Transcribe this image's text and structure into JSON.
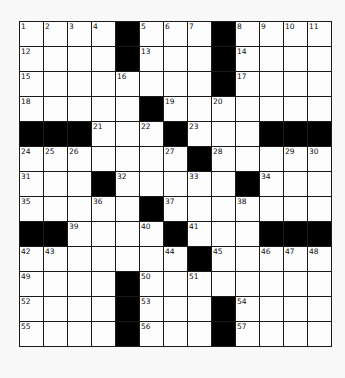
{
  "puzzle": {
    "rows": 13,
    "cols": 13,
    "colors": {
      "background": "#f8f8f8",
      "cell": "#fdfdfd",
      "block": "#000000",
      "gridline": "#1a1a1a",
      "number": "#111111"
    },
    "layout": [
      "....#...#....",
      "....#...#....",
      "........#....",
      ".....#.......",
      "###...#...###",
      ".......#.....",
      "...#.....#...",
      ".....#.......",
      "##....#...###",
      ".......#.....",
      "....#........",
      "....#...#....",
      "....#...#...."
    ],
    "numbers": [
      [
        "1",
        "2",
        "3",
        "4",
        "",
        "5",
        "6",
        "7",
        "",
        "8",
        "9",
        "10",
        "11"
      ],
      [
        "12",
        "",
        "",
        "",
        "",
        "13",
        "",
        "",
        "",
        "14",
        "",
        "",
        ""
      ],
      [
        "15",
        "",
        "",
        "",
        "16",
        "",
        "",
        "",
        "",
        "17",
        "",
        "",
        ""
      ],
      [
        "18",
        "",
        "",
        "",
        "",
        "",
        "19",
        "",
        "20",
        "",
        "",
        "",
        ""
      ],
      [
        "",
        "",
        "",
        "21",
        "",
        "22",
        "",
        "23",
        "",
        "",
        "",
        "",
        ""
      ],
      [
        "24",
        "25",
        "26",
        "",
        "",
        "",
        "27",
        "",
        "28",
        "",
        "",
        "29",
        "30"
      ],
      [
        "31",
        "",
        "",
        "",
        "32",
        "",
        "",
        "33",
        "",
        "",
        "34",
        "",
        ""
      ],
      [
        "35",
        "",
        "",
        "36",
        "",
        "",
        "37",
        "",
        "",
        "38",
        "",
        "",
        ""
      ],
      [
        "",
        "",
        "39",
        "",
        "",
        "40",
        "",
        "41",
        "",
        "",
        "",
        "",
        ""
      ],
      [
        "42",
        "43",
        "",
        "",
        "",
        "",
        "44",
        "",
        "45",
        "",
        "46",
        "47",
        "48"
      ],
      [
        "49",
        "",
        "",
        "",
        "",
        "50",
        "",
        "51",
        "",
        "",
        "",
        "",
        ""
      ],
      [
        "52",
        "",
        "",
        "",
        "",
        "53",
        "",
        "",
        "",
        "54",
        "",
        "",
        ""
      ],
      [
        "55",
        "",
        "",
        "",
        "",
        "56",
        "",
        "",
        "",
        "57",
        "",
        "",
        ""
      ]
    ]
  }
}
